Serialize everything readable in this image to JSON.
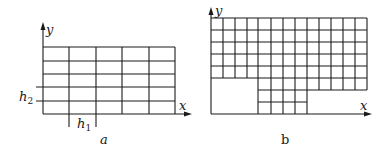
{
  "figure_a": {
    "caption": "a",
    "x_axis_label": "x",
    "y_axis_label": "y",
    "h1_label": "h",
    "h1_sub": "1",
    "h2_label": "h",
    "h2_sub": "2",
    "grid": {
      "columns": 5,
      "rows": 5
    }
  },
  "figure_b": {
    "caption": "b",
    "x_axis_label": "x",
    "y_axis_label": "y",
    "grid": {
      "columns": 13,
      "full_rows": 5,
      "partial_rows": [
        {
          "from_col": 4,
          "to_col": 13
        },
        {
          "from_col": 4,
          "to_col": 8
        },
        {
          "from_col": 4,
          "to_col": 8
        }
      ]
    }
  }
}
